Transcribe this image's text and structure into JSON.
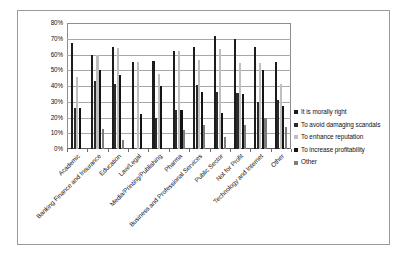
{
  "chart_data": {
    "type": "bar",
    "title": "",
    "subtitle": "",
    "xlabel": "",
    "ylabel": "",
    "ylim": [
      0,
      80
    ],
    "ytick_labels": [
      "80%",
      "70%",
      "60%",
      "50%",
      "40%",
      "30%",
      "20%",
      "10%",
      "0%"
    ],
    "ytick_values": [
      80,
      70,
      60,
      50,
      40,
      30,
      20,
      10,
      0
    ],
    "grid": true,
    "legend_position": "right",
    "categories": [
      "Academic",
      "Banking Finance and Insurance",
      "Education",
      "Law/Legal",
      "Media/Printing/Publishing",
      "Pharma",
      "Business and Professional Services",
      "Public Sector",
      "Not for Profit",
      "Technology and Internet",
      "Other"
    ],
    "series": [
      {
        "name": "It is morally right",
        "color": "#1c1c1c",
        "values": [
          67,
          60,
          64.5,
          55.5,
          56,
          62,
          64.5,
          71.5,
          70,
          65,
          55.5
        ]
      },
      {
        "name": "To avoid damaging scandals",
        "color": "#2b2b2b",
        "values": [
          26,
          43,
          41,
          0,
          19.5,
          25,
          40.5,
          36,
          35.5,
          30,
          31
        ]
      },
      {
        "name": "To enhance reputation",
        "color": "#bfbfbf",
        "values": [
          46,
          59.5,
          64,
          55.5,
          47.5,
          62,
          56.5,
          63.5,
          54.5,
          54.5,
          41
        ]
      },
      {
        "name": "To increase profitability",
        "color": "#141414",
        "values": [
          26,
          50,
          47,
          22,
          40,
          24.5,
          36.5,
          23,
          35,
          50,
          27.5
        ]
      },
      {
        "name": "Other",
        "color": "#7d7d7d",
        "values": [
          0,
          13,
          5.5,
          0,
          0,
          12,
          15,
          7.5,
          15,
          20,
          14
        ]
      }
    ]
  }
}
